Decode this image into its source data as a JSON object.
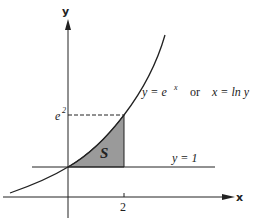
{
  "diagram": {
    "axes": {
      "x_label": "x",
      "y_label": "y",
      "x_tick": "2",
      "y_tick_base": "e",
      "y_tick_exp": "2"
    },
    "curve_label": {
      "y_part": "y = e",
      "y_exp": "x",
      "or": "or",
      "x_part": "x = ln y"
    },
    "line_label": "y = 1",
    "region_label": "S",
    "colors": {
      "ink": "#222222",
      "region_fill": "#9a9a9a"
    }
  }
}
